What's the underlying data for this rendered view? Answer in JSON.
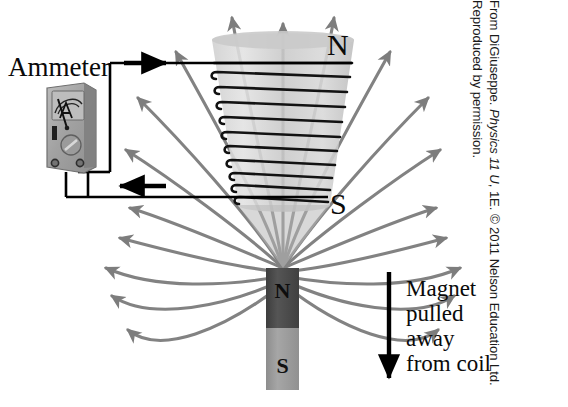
{
  "labels": {
    "ammeter": "Ammeter",
    "coil_north_pole": "N",
    "coil_south_pole": "S",
    "magnet_north_pole": "N",
    "magnet_south_pole": "S",
    "meter_face_symbol": "A"
  },
  "caption": {
    "magnet_motion": "Magnet pulled away from coil"
  },
  "attribution": {
    "prefix": "From DiGiuseppe. ",
    "italic_title": "Physics 11 U",
    "suffix": ", 1E. © 2011 Nelson Education Ltd. Reproduced by permission.",
    "full": "From DiGiuseppe. Physics 11 U, 1E. © 2011 Nelson Education Ltd. Reproduced by permission."
  },
  "colors": {
    "background": "#ffffff",
    "field_line": "#808080",
    "coil_wire": "#111111",
    "circuit_wire": "#000000",
    "coil_body_light": "#d9d9d9",
    "coil_body_mid": "#c2c2c2",
    "magnet_north": "#4a4a4a",
    "magnet_south": "#9a9a9a",
    "meter_body": "#a8a8a8",
    "text": "#0a0a0a"
  },
  "diagram": {
    "coil_turns": 11,
    "field_lines_upward": 9,
    "field_lines_lateral": 6,
    "current_arrows": [
      {
        "name": "top-wire-current-arrow",
        "direction": "right"
      },
      {
        "name": "bottom-wire-current-arrow",
        "direction": "left"
      }
    ],
    "motion_arrow": {
      "name": "magnet-motion-arrow",
      "direction": "down"
    }
  }
}
